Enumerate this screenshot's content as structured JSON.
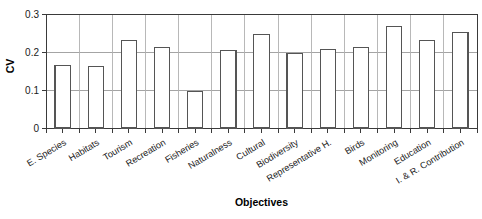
{
  "chart_data": {
    "type": "bar",
    "title": "",
    "xlabel": "Objectives",
    "ylabel": "CV",
    "categories": [
      "E. Species",
      "Habitats",
      "Tourism",
      "Recreation",
      "Fisheries",
      "Naturalness",
      "Cultural",
      "Biodiversity",
      "Representative H.",
      "Birds",
      "Monitoring",
      "Education",
      "I. & R. Contribution"
    ],
    "values": [
      0.165,
      0.163,
      0.23,
      0.213,
      0.095,
      0.203,
      0.245,
      0.196,
      0.206,
      0.212,
      0.267,
      0.231,
      0.252
    ],
    "ylim": [
      0,
      0.3
    ],
    "ytick_labels": [
      "0",
      "0.1",
      "0.2",
      "0.3"
    ],
    "ytick_values": [
      0,
      0.1,
      0.2,
      0.3
    ],
    "grid": {
      "horizontal": true,
      "vertical": true
    },
    "legend": null,
    "bar_style": {
      "fill": "#ffffff",
      "edge": "#555555"
    }
  },
  "axes": {
    "x_title": "Objectives",
    "y_title": "CV"
  }
}
